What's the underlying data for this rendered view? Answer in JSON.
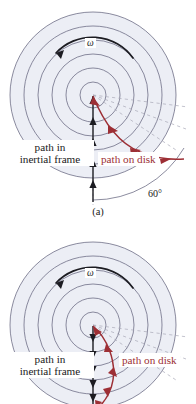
{
  "document": {
    "kind": "physics-figure",
    "description": "Two panel figure of a rotating disk showing a straight path in the inertial frame and a curved path traced on the rotating disk"
  },
  "colors": {
    "disk_fill": "#eceef5",
    "disk_stroke": "#6f6f86",
    "path_inertial": "#1c1c22",
    "path_on_disk": "#9d2f35",
    "radial_dashed": "#a9a9b8",
    "background": "#ffffff",
    "text": "#1a1a1a"
  },
  "figures": [
    {
      "id": "a",
      "caption": "(a)",
      "omega_label": "ω",
      "rotation_icon": "counterclockwise-arrow-icon",
      "labels": {
        "inertial_line1": "path in",
        "inertial_line2": "inertial frame",
        "on_disk": "path on disk",
        "angle": "60°"
      },
      "disk": {
        "center_x": 93,
        "center_y": 95,
        "radii": [
          13,
          27,
          41,
          55,
          69,
          83
        ],
        "ring_count": 6
      },
      "inertial_path": {
        "direction": "upward",
        "from": [
          93,
          200
        ],
        "to": [
          93,
          96
        ],
        "arrow_count": 5
      },
      "disk_path": {
        "shape": "curve-bowing-downward-right",
        "arrow_count": 4,
        "start": [
          93,
          96
        ],
        "end": [
          182,
          159
        ]
      },
      "radial_dashed_count": 3
    },
    {
      "id": "b",
      "caption": "(b)",
      "omega_label": "ω",
      "rotation_icon": "counterclockwise-arrow-icon",
      "labels": {
        "inertial_line1": "path in",
        "inertial_line2": "inertial frame",
        "on_disk": "path on disk",
        "angle": ""
      },
      "disk": {
        "center_x": 93,
        "center_y": 103,
        "radii": [
          13,
          27,
          41,
          55,
          69,
          83
        ],
        "ring_count": 6
      },
      "inertial_path": {
        "direction": "downward",
        "from": [
          93,
          104
        ],
        "to": [
          93,
          182
        ],
        "arrow_count": 6
      },
      "disk_path": {
        "shape": "curve-bowing-right",
        "arrow_count": 5,
        "start": [
          93,
          104
        ],
        "end": [
          99,
          184
        ]
      },
      "radial_dashed_count": 3
    }
  ]
}
